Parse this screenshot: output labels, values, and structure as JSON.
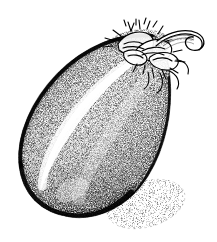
{
  "image": {
    "subject": "eggplant",
    "alt_title": "Eggplant (aubergine) stipple engraving",
    "style": "stipple-engraving",
    "medium": "pen-and-ink dot stipple",
    "palette": {
      "ink": "#000000",
      "background": "#ffffff",
      "midtone": "#4a4a4a",
      "highlight": "#ffffff",
      "shadow_tone": "#9a9a9a"
    },
    "canvas": {
      "width": 217,
      "height": 242
    }
  },
  "parts": {
    "fruit_body": {
      "name": "eggplant-fruit-body",
      "description": "large teardrop fruit tilted from lower-left to upper-right"
    },
    "highlight": {
      "name": "specular-highlight",
      "description": "bright white crescent band along the upper-left face"
    },
    "calyx": {
      "name": "calyx-sepals",
      "description": "spiky star-shaped sepals crowning the top of the fruit"
    },
    "stem": {
      "name": "stem",
      "description": "curved hooked stalk angling to the right"
    },
    "cast_shadow": {
      "name": "cast-shadow",
      "description": "soft stippled ellipse on the ground to the lower right"
    }
  },
  "labels": {
    "figure_caption": "",
    "signature": ""
  }
}
